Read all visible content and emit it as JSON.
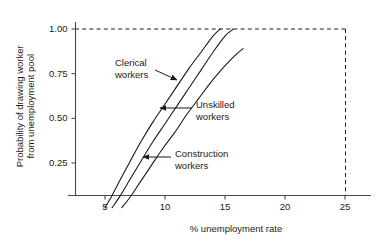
{
  "chart_data": {
    "type": "line",
    "title": "",
    "xlabel": "% unemployment rate",
    "ylabel": "Probability of drawing worker from unemployment pool",
    "ylabel_line1": "Probability of drawing worker",
    "ylabel_line2": "from unemployment pool",
    "xlim": [
      3.2,
      26.5
    ],
    "ylim": [
      0.0,
      1.06
    ],
    "xticks": [
      5,
      10,
      15,
      20,
      25
    ],
    "xticklabels": [
      "5",
      "10",
      "15",
      "20",
      "25"
    ],
    "yticks": [
      0.25,
      0.5,
      0.75,
      1.0
    ],
    "yticklabels": [
      "0.25",
      "0.50",
      "0.75",
      "1.00"
    ],
    "grid": false,
    "legend_position": "inline-annotations",
    "reference_lines": [
      {
        "name": "probability-ceiling",
        "orientation": "horizontal",
        "value": 1.0,
        "style": "dashed"
      },
      {
        "name": "unemployment-ceiling",
        "orientation": "vertical",
        "value": 25,
        "style": "dashed"
      }
    ],
    "series": [
      {
        "name": "Clerical workers",
        "color": "#1a1a1a",
        "x": [
          5.0,
          5.6,
          6.3,
          7.1,
          8.0,
          9.0,
          10.0,
          11.0,
          12.0,
          13.0,
          14.0,
          14.6
        ],
        "y": [
          0.0,
          0.07,
          0.16,
          0.26,
          0.37,
          0.48,
          0.58,
          0.68,
          0.78,
          0.87,
          0.96,
          1.0
        ]
      },
      {
        "name": "Unskilled workers",
        "color": "#1a1a1a",
        "x": [
          5.6,
          6.3,
          7.1,
          8.0,
          9.0,
          10.0,
          11.0,
          12.0,
          13.0,
          14.0,
          15.0,
          15.7
        ],
        "y": [
          0.0,
          0.07,
          0.16,
          0.26,
          0.37,
          0.47,
          0.57,
          0.67,
          0.77,
          0.87,
          0.96,
          1.0
        ]
      },
      {
        "name": "Construction workers",
        "color": "#1a1a1a",
        "x": [
          6.4,
          7.1,
          7.9,
          8.8,
          9.8,
          10.8,
          11.8,
          12.8,
          13.8,
          14.8,
          15.8,
          16.5
        ],
        "y": [
          0.0,
          0.06,
          0.14,
          0.23,
          0.33,
          0.42,
          0.52,
          0.61,
          0.7,
          0.78,
          0.85,
          0.89
        ]
      }
    ],
    "annotations": [
      {
        "name": "clerical-workers",
        "line1": "Clerical",
        "line2": "workers",
        "text_x": 115,
        "text_y": 57,
        "arrow_from": [
          155,
          70
        ],
        "arrow_to": [
          177,
          80
        ]
      },
      {
        "name": "unskilled-workers",
        "line1": "Unskilled",
        "line2": "workers",
        "text_x": 196,
        "text_y": 99,
        "arrow_from": [
          192,
          108
        ],
        "arrow_to": [
          160,
          108
        ]
      },
      {
        "name": "construction-workers",
        "line1": "Construction",
        "line2": "workers",
        "text_x": 175,
        "text_y": 148,
        "arrow_from": [
          171,
          157
        ],
        "arrow_to": [
          143,
          157
        ]
      }
    ]
  }
}
